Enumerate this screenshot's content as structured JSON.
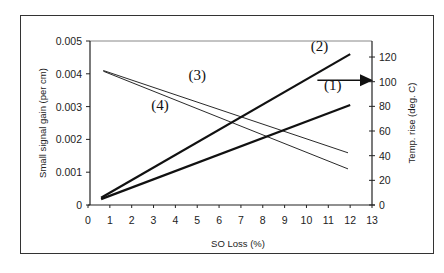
{
  "chart_data": {
    "type": "line",
    "title": "",
    "xlabel": "SO Loss (%)",
    "ylabel": "Small signal gain (per cm)",
    "y2label": "Temp. rise (deg. C)",
    "xlim": [
      0,
      13
    ],
    "ylim": [
      0,
      0.005
    ],
    "y2lim": [
      0,
      133
    ],
    "xticks": [
      "0",
      "1",
      "2",
      "3",
      "4",
      "5",
      "6",
      "7",
      "8",
      "9",
      "10",
      "11",
      "12",
      "13"
    ],
    "yticks": [
      "0",
      "0.001",
      "0.002",
      "0.003",
      "0.004",
      "0.005"
    ],
    "y2ticks": [
      "0",
      "20",
      "40",
      "60",
      "80",
      "100",
      "120"
    ],
    "grid": false,
    "series": [
      {
        "name": "(1)",
        "axis": "left",
        "weight": "bold",
        "x": [
          0.6,
          12
        ],
        "y": [
          0.00018,
          0.00305
        ]
      },
      {
        "name": "(2)",
        "axis": "left",
        "weight": "bold",
        "x": [
          0.6,
          12
        ],
        "y": [
          0.00022,
          0.0046
        ]
      },
      {
        "name": "(3)",
        "axis": "left",
        "weight": "thin",
        "x": [
          0.7,
          11.9
        ],
        "y": [
          0.0041,
          0.00159
        ]
      },
      {
        "name": "(4)",
        "axis": "left",
        "weight": "thin",
        "x": [
          0.7,
          11.9
        ],
        "y": [
          0.00408,
          0.0011
        ]
      }
    ],
    "annotations": [
      {
        "text": "(1)",
        "x": 11.2,
        "y": 0.0035
      },
      {
        "text": "(2)",
        "x": 10.6,
        "y": 0.0047
      },
      {
        "text": "(3)",
        "x": 5.0,
        "y": 0.0038
      },
      {
        "text": "(4)",
        "x": 3.3,
        "y": 0.0029
      },
      {
        "text": "arrow-right",
        "x": 10.5,
        "y": 0.0038,
        "points_to": "right-axis"
      }
    ]
  }
}
